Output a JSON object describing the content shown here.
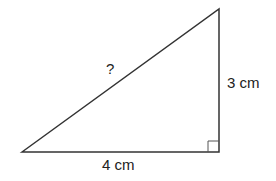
{
  "diagram": {
    "type": "right-triangle",
    "labels": {
      "hypotenuse": "?",
      "vertical_side": "3 cm",
      "base": "4 cm"
    },
    "right_angle_marker": true,
    "colors": {
      "stroke": "#333333",
      "background": "#ffffff"
    }
  }
}
